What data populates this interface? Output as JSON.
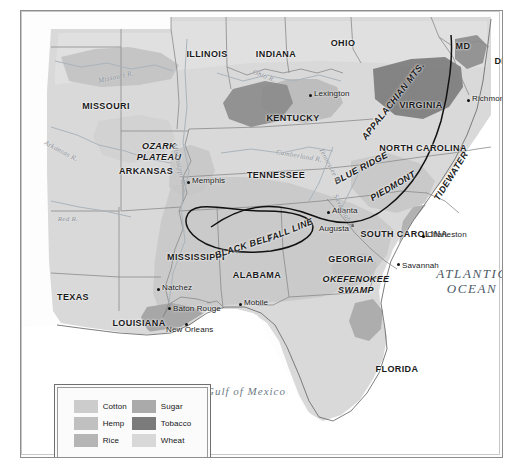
{
  "map": {
    "title": "Agricultural Regions of the Antebellum South",
    "frame": {
      "border_color": "#8d8d8d"
    },
    "palette": {
      "cotton": "#c9c9c9",
      "hemp": "#bdbdbd",
      "rice": "#b4b4b4",
      "sugar": "#a9a9a9",
      "tobacco": "#7d7d7d",
      "wheat": "#dedede",
      "land_base": "#d6d6d6",
      "ocean": "#ffffff",
      "boundary": "#8a8a8a",
      "coast": "#6f6f6f",
      "river": "#a8b2ba",
      "annotation_line": "#111111"
    },
    "states": [
      {
        "name": "ILLINOIS",
        "x": 186,
        "y": 38
      },
      {
        "name": "INDIANA",
        "x": 255,
        "y": 38
      },
      {
        "name": "OHIO",
        "x": 322,
        "y": 27
      },
      {
        "name": "MD",
        "x": 442,
        "y": 30
      },
      {
        "name": "DEL",
        "x": 483,
        "y": 45
      },
      {
        "name": "MISSOURI",
        "x": 85,
        "y": 90
      },
      {
        "name": "KENTUCKY",
        "x": 272,
        "y": 102
      },
      {
        "name": "VIRGINIA",
        "x": 400,
        "y": 89
      },
      {
        "name": "ARKANSAS",
        "x": 125,
        "y": 155
      },
      {
        "name": "TENNESSEE",
        "x": 255,
        "y": 159
      },
      {
        "name": "NORTH CAROLINA",
        "x": 402,
        "y": 132
      },
      {
        "name": "SOUTH CAROLINA",
        "x": 383,
        "y": 218
      },
      {
        "name": "MISSISSIPPI",
        "x": 175,
        "y": 241
      },
      {
        "name": "ALABAMA",
        "x": 236,
        "y": 259
      },
      {
        "name": "GEORGIA",
        "x": 330,
        "y": 243
      },
      {
        "name": "TEXAS",
        "x": 52,
        "y": 281
      },
      {
        "name": "LOUISIANA",
        "x": 118,
        "y": 307
      },
      {
        "name": "FLORIDA",
        "x": 376,
        "y": 353
      }
    ],
    "regions": [
      {
        "name": "OZARK",
        "x": 138,
        "y": 130
      },
      {
        "name": "PLATEAU",
        "x": 138,
        "y": 141
      },
      {
        "name": "OKEFENOKEE",
        "x": 335,
        "y": 263
      },
      {
        "name": "SWAMP",
        "x": 335,
        "y": 274
      },
      {
        "name": "APPALACHIAN MTS.",
        "x": 372,
        "y": 85,
        "rotate": -52
      },
      {
        "name": "BLUE RIDGE",
        "x": 340,
        "y": 152,
        "rotate": -28
      },
      {
        "name": "PIEDMONT",
        "x": 372,
        "y": 170,
        "rotate": -30
      },
      {
        "name": "TIDEWATER",
        "x": 430,
        "y": 160,
        "rotate": -58
      },
      {
        "name": "BLACK BELT",
        "x": 223,
        "y": 230,
        "rotate": -18
      },
      {
        "name": "FALL LINE",
        "x": 269,
        "y": 214,
        "rotate": -22
      }
    ],
    "cities": [
      {
        "name": "Lexington",
        "x": 288,
        "y": 83,
        "lx": 293,
        "ly": 78
      },
      {
        "name": "Richmond",
        "x": 446,
        "y": 88,
        "lx": 451,
        "ly": 83
      },
      {
        "name": "Memphis",
        "x": 166,
        "y": 170,
        "lx": 171,
        "ly": 165
      },
      {
        "name": "Atlanta",
        "x": 306,
        "y": 200,
        "lx": 311,
        "ly": 195
      },
      {
        "name": "Augusta",
        "x": 330,
        "y": 213,
        "lx": 298,
        "ly": 213
      },
      {
        "name": "Charleston",
        "x": 401,
        "y": 224,
        "lx": 406,
        "ly": 219
      },
      {
        "name": "Savannah",
        "x": 376,
        "y": 252,
        "lx": 381,
        "ly": 250
      },
      {
        "name": "Natchez",
        "x": 136,
        "y": 277,
        "lx": 141,
        "ly": 272
      },
      {
        "name": "Mobile",
        "x": 218,
        "y": 292,
        "lx": 223,
        "ly": 287
      },
      {
        "name": "Baton Rouge",
        "x": 147,
        "y": 296,
        "lx": 152,
        "ly": 293
      },
      {
        "name": "New Orleans",
        "x": 164,
        "y": 312,
        "lx": 145,
        "ly": 314
      }
    ],
    "waters": [
      {
        "name": "ATLANTIC",
        "x": 451,
        "y": 255
      },
      {
        "name": "OCEAN",
        "x": 451,
        "y": 270
      },
      {
        "name": "Gulf of Mexico",
        "x": 225,
        "y": 374
      }
    ],
    "rivers": [
      {
        "name": "Missouri R.",
        "x": 95,
        "y": 62,
        "rotate": -12
      },
      {
        "name": "Ohio R.",
        "x": 243,
        "y": 61,
        "rotate": 22
      },
      {
        "name": "Arkansas R.",
        "x": 40,
        "y": 136,
        "rotate": 28
      },
      {
        "name": "Red R.",
        "x": 47,
        "y": 204,
        "rotate": 0
      },
      {
        "name": "Mississippi R.",
        "x": 158,
        "y": 150,
        "rotate": 78
      },
      {
        "name": "Cumberland R.",
        "x": 278,
        "y": 141,
        "rotate": 10
      },
      {
        "name": "Tennessee R.",
        "x": 309,
        "y": 151,
        "rotate": 62
      },
      {
        "name": "Savannah R.",
        "x": 323,
        "y": 197,
        "rotate": 62
      }
    ],
    "legend": {
      "items": [
        {
          "label": "Cotton",
          "color": "#cccccc"
        },
        {
          "label": "Sugar",
          "color": "#aaaaaa"
        },
        {
          "label": "Hemp",
          "color": "#c0c0c0"
        },
        {
          "label": "Tobacco",
          "color": "#7b7b7b"
        },
        {
          "label": "Rice",
          "color": "#b5b5b5"
        },
        {
          "label": "Wheat",
          "color": "#d8d8d8"
        }
      ]
    }
  }
}
